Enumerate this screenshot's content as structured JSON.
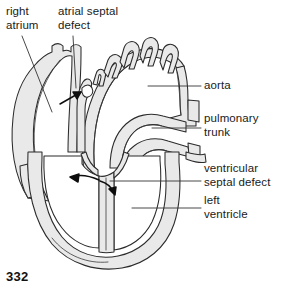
{
  "figure": {
    "page_number": "332",
    "colors": {
      "ink": "#1a1a1a",
      "outline": "#2b2b2b",
      "tissue_fill": "#e9e9e9",
      "lumen_fill": "#ffffff",
      "background": "#ffffff",
      "leader_line": "#333333"
    }
  },
  "labels": {
    "right_atrium": "right\natrium",
    "atrial_septal_defect": "atrial septal\ndefect",
    "aorta": "aorta",
    "pulmonary_trunk": "pulmonary\ntrunk",
    "ventricular_septal_defect": "ventricular\nseptal defect",
    "left_ventricle": "left\nventricle"
  },
  "annotations": {
    "arrow_asd": "arrow through atrial septal defect pointing superior-right",
    "arrow_vsd_left": "curved arrow pointing left through ventricular septal defect",
    "arrow_vsd_right": "curved arrow pointing right at ventricular septal defect"
  },
  "structures": [
    "right atrium",
    "superior vena cava",
    "aortic arch",
    "brachiocephalic branches",
    "pulmonary trunk",
    "interatrial septum",
    "interventricular septum",
    "left ventricle",
    "right ventricle",
    "ventricular myocardium"
  ]
}
